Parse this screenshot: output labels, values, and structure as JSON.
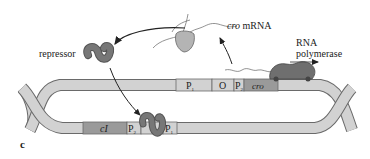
{
  "figure": {
    "panel_label": "c",
    "labels": {
      "repressor": "repressor",
      "cro_mrna_italic": "cro",
      "cro_mrna_rest": " mRNA",
      "rna_polymerase_line1": "RNA",
      "rna_polymerase_line2": "polymerase"
    },
    "top_strand": {
      "segments": [
        {
          "main": "P",
          "sub": "1"
        },
        {
          "main": "O",
          "sub": ""
        },
        {
          "main": "P",
          "sub": "2"
        },
        {
          "main": "cro",
          "sub": "",
          "italic": true
        }
      ]
    },
    "bottom_strand": {
      "segments": [
        {
          "main": "cI",
          "sub": "",
          "italic": true
        },
        {
          "main": "P",
          "sub": "2"
        },
        {
          "main": "P",
          "sub": "1"
        }
      ]
    },
    "colors": {
      "dna_fill": "#d2d2d2",
      "dna_stroke": "#6a6a6a",
      "gene_fill": "#9a9a9a",
      "protein_fill": "#6f6f6f",
      "ribosome_fill": "#b4b4b4",
      "text": "#222222"
    }
  }
}
